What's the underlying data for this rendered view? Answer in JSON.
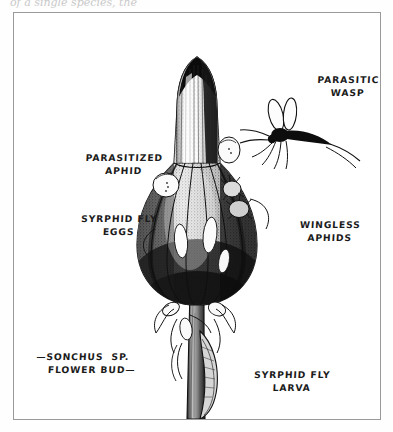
{
  "page": {
    "cut_off_header_text": "of a single species, the",
    "background_color": "#ffffff",
    "frame_color": "#9a9a9a",
    "ink_color": "#1b1b1b"
  },
  "illustration": {
    "subject": "Sonchus sp. flower bud with aphids, syrphid fly eggs and larva, and a parasitic wasp",
    "medium": "pen-and-ink stipple drawing",
    "icons": {
      "bud": "flower-bud-icon",
      "wasp": "parasitic-wasp-icon",
      "larva": "syrphid-fly-larva-icon",
      "egg": "syrphid-fly-egg-icon",
      "aphid": "wingless-aphid-icon",
      "mummy": "parasitized-aphid-icon",
      "stem": "plant-stem-icon"
    }
  },
  "labels": {
    "parasitic_wasp": "PARASITIC\nWASP",
    "parasitized_aphid": "PARASITIZED\nAPHID",
    "syrphid_fly_eggs": "SYRPHID FLY\nEGGS",
    "wingless_aphids": "WINGLESS\nAPHIDS",
    "caption": "—SONCHUS  SP.\n   FLOWER BUD—",
    "syrphid_fly_larva": "SYRPHID FLY\nLARVA"
  }
}
